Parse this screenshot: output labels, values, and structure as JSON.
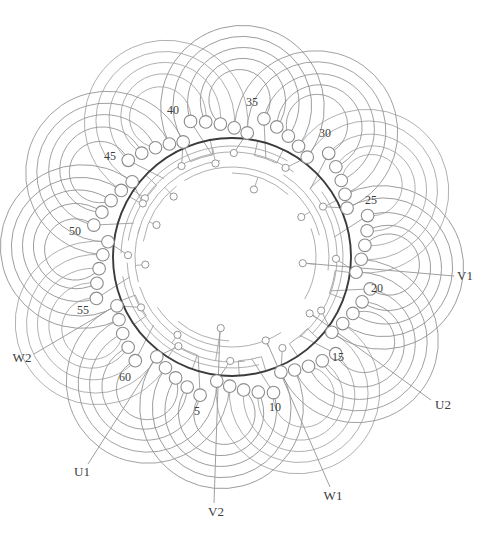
{
  "figure": {
    "width": 495,
    "height": 544,
    "center": {
      "x": 232,
      "y": 257
    },
    "bold_ring_r": 119,
    "slot_ring": {
      "count": 60,
      "angle0": 133,
      "step_deg": 6,
      "base_r": 125,
      "cascade_step": 4.2,
      "group_size": 5,
      "circle_r": 6.3
    },
    "petals": {
      "groups": 12,
      "coils_per_group": 5,
      "reach_base": 188,
      "reach_step": 11
    },
    "rails": [
      [
        111,
        -178,
        -60
      ],
      [
        105,
        -171,
        -54
      ],
      [
        111,
        -36,
        44
      ],
      [
        105,
        -28,
        50
      ],
      [
        111,
        76,
        170
      ],
      [
        105,
        83,
        177
      ],
      [
        97,
        -166,
        -97
      ],
      [
        97,
        -58,
        8
      ],
      [
        97,
        97,
        162
      ],
      [
        97,
        165,
        198
      ],
      [
        90,
        -170,
        -128
      ],
      [
        90,
        -122,
        -14
      ],
      [
        90,
        57,
        146
      ],
      [
        84,
        -90,
        -48
      ],
      [
        84,
        -20,
        30
      ],
      [
        84,
        92,
        130
      ]
    ],
    "brackets": {
      "angles": [
        -143,
        -107,
        -71,
        -35,
        14,
        50,
        80,
        116,
        152
      ],
      "outer_r": 119,
      "inner_r": 104,
      "half_width_deg": 6.5
    },
    "inner_nodes": [
      [
        71,
        5,
        84
      ],
      [
        72,
        99,
        105
      ],
      [
        71,
        -72,
        84
      ],
      [
        80,
        -30,
        90
      ],
      [
        90,
        68,
        97
      ],
      [
        96,
        36,
        105
      ],
      [
        95,
        -100,
        111
      ],
      [
        105,
        -146,
        119
      ],
      [
        82,
        -157,
        90
      ],
      [
        87,
        175,
        97
      ],
      [
        95,
        125,
        105
      ],
      [
        84,
        -134,
        97
      ]
    ],
    "lead_ins": {
      "tap_r": 104,
      "offset_deg": 6,
      "node_r": 3.6
    },
    "colors": {
      "loop_palette": [
        "#8a8a8a",
        "#a2a2a2",
        "#909090"
      ],
      "rail": "#a6a6a6",
      "bracket": "#a0a0a0",
      "lead_in": "#9b9b9b",
      "bold_ring": "#3b3b3b",
      "slot_circle_stroke": "#8c8c8c",
      "node_stroke": "#959595",
      "leader": "#9a9a9a",
      "label_text": "#3d3d3d",
      "background": "#ffffff"
    }
  },
  "slot_labels": [
    {
      "text": "5",
      "x": 197,
      "y": 415
    },
    {
      "text": "10",
      "x": 275,
      "y": 411
    },
    {
      "text": "15",
      "x": 338,
      "y": 361
    },
    {
      "text": "20",
      "x": 377,
      "y": 292
    },
    {
      "text": "25",
      "x": 371,
      "y": 204
    },
    {
      "text": "30",
      "x": 325,
      "y": 137
    },
    {
      "text": "35",
      "x": 252,
      "y": 106
    },
    {
      "text": "40",
      "x": 173,
      "y": 114
    },
    {
      "text": "45",
      "x": 110,
      "y": 160
    },
    {
      "text": "50",
      "x": 75,
      "y": 235
    },
    {
      "text": "55",
      "x": 83,
      "y": 314
    },
    {
      "text": "60",
      "x": 125,
      "y": 381
    }
  ],
  "terminals": [
    {
      "text": "U1",
      "x": 82,
      "y": 476,
      "leader": {
        "x1": 155,
        "y1": 359,
        "x2": 88,
        "y2": 464
      }
    },
    {
      "text": "V2",
      "x": 216,
      "y": 516,
      "leader": {
        "x1": 220,
        "y1": 330,
        "x2": 214,
        "y2": 503
      }
    },
    {
      "text": "W1",
      "x": 333,
      "y": 500,
      "leader": {
        "x1": 266,
        "y1": 340,
        "x2": 330,
        "y2": 487
      }
    },
    {
      "text": "U2",
      "x": 443,
      "y": 409,
      "leader": {
        "x1": 310,
        "y1": 313,
        "x2": 431,
        "y2": 400
      }
    },
    {
      "text": "V1",
      "x": 465,
      "y": 280,
      "leader": {
        "x1": 303,
        "y1": 263,
        "x2": 454,
        "y2": 276
      }
    },
    {
      "text": "W2",
      "x": 22,
      "y": 362,
      "leader": {
        "x1": 107,
        "y1": 311,
        "x2": 34,
        "y2": 354
      }
    }
  ]
}
